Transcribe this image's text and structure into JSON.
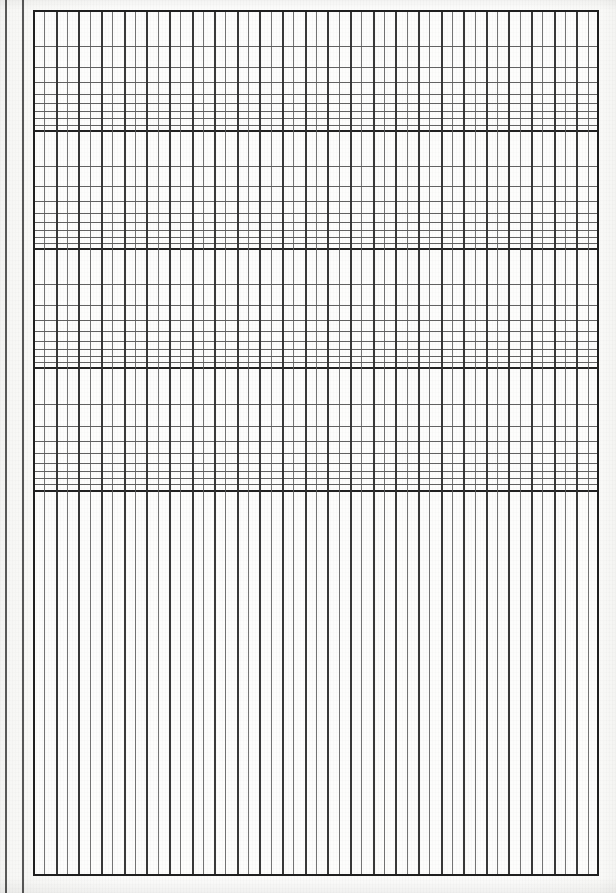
{
  "document": {
    "title": "Semi-logarithmic graph paper sheet",
    "kind": "graph-paper-scan",
    "width": 616,
    "height": 893,
    "background_color": "#fbfbfa",
    "paper_color": "#fdfdfc",
    "line_color": "#4c4c4c",
    "heavy_line_color": "#1f1f1f"
  },
  "margin": {
    "name": "left-binding-margin",
    "rules": [
      {
        "label": "outer-margin-rule",
        "x": 5,
        "width": 2
      },
      {
        "label": "inner-margin-rule",
        "x": 22,
        "width": 2
      }
    ]
  },
  "grid": {
    "name": "semi-log-grid",
    "left": 33,
    "top": 10,
    "right": 599,
    "bottom": 876,
    "log_section_bottom": 490,
    "vertical": {
      "description": "uniform linear vertical rulings, every second line heavier",
      "spacing": 11.32,
      "count": 51,
      "major_every": 2
    },
    "horizontal": {
      "description": "logarithmic cycles, decade boundaries drawn heavy",
      "cycles": 4,
      "decade_boundaries": [
        10,
        130,
        248,
        367,
        490
      ],
      "minor_divisions_per_cycle": 9,
      "cycle_labels": [
        "1",
        "2",
        "3",
        "4",
        "5",
        "6",
        "7",
        "8",
        "9",
        "10"
      ]
    }
  },
  "chart_data": {
    "type": "table",
    "title": "Semi-logarithmic graph paper",
    "xlabel": "",
    "ylabel": "",
    "grid": "on",
    "legend": "none",
    "categories": [],
    "values": []
  }
}
